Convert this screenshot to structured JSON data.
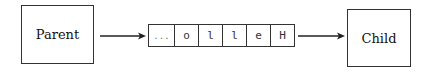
{
  "diagram": {
    "parent_label": "Parent",
    "child_label": "Child",
    "buffer_cells": [
      "...",
      "o",
      "l",
      "l",
      "e",
      "H"
    ],
    "colors": {
      "stroke": "#333333",
      "background": "#ffffff",
      "text": "#111111"
    }
  }
}
